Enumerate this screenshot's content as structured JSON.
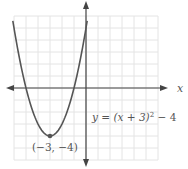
{
  "chart_data": {
    "type": "line",
    "title": "",
    "equation": "y = (x + 3)² − 4",
    "equation_parts": {
      "lhs": "y = (x + 3)",
      "exp": "2",
      "rhs": " − 4"
    },
    "xlabel": "x",
    "ylabel": "",
    "xlim": [
      -6,
      6
    ],
    "ylim": [
      -6,
      6
    ],
    "grid": true,
    "grid_step": 1,
    "series": [
      {
        "name": "y = (x + 3)^2 - 4",
        "x": [
          -6.1,
          -5,
          -4,
          -3,
          -2,
          -1,
          0,
          0.1
        ],
        "y": [
          5.61,
          0,
          -3,
          -4,
          -3,
          0,
          5,
          5.61
        ]
      }
    ],
    "annotations": [
      {
        "label": "(−3, −4)",
        "x": -3,
        "y": -4,
        "marker": "dot"
      }
    ]
  },
  "colors": {
    "curve": "#555555",
    "axis": "#444444",
    "grid": "#e4e4e4",
    "text": "#555555"
  }
}
